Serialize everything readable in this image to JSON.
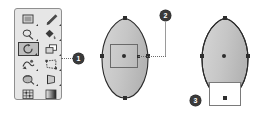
{
  "canvas": {
    "width": 262,
    "height": 120,
    "background": "#ffffff"
  },
  "palette": {
    "name": "tools-palette",
    "background": "#e6e6e6",
    "border": "#8f8f8f",
    "selected_index": 4,
    "tools": [
      {
        "icon": "rectangle-fill-icon",
        "label": "Rectangle",
        "has_flyout": true,
        "selected": false
      },
      {
        "icon": "pencil-icon",
        "label": "Pencil",
        "has_flyout": true,
        "selected": false
      },
      {
        "icon": "lasso-icon",
        "label": "Lasso",
        "has_flyout": true,
        "selected": false
      },
      {
        "icon": "paint-bucket-icon",
        "label": "Paint Bucket",
        "has_flyout": true,
        "selected": false
      },
      {
        "icon": "rotate-tool-icon",
        "label": "Rotate",
        "has_flyout": true,
        "selected": true
      },
      {
        "icon": "transform-copy-icon",
        "label": "Transform",
        "has_flyout": true,
        "selected": false
      },
      {
        "icon": "warp-icon",
        "label": "Warp",
        "has_flyout": true,
        "selected": false
      },
      {
        "icon": "free-distort-icon",
        "label": "Free Distort",
        "has_flyout": true,
        "selected": false
      },
      {
        "icon": "rotate-3d-icon",
        "label": "3D Rotate",
        "has_flyout": true,
        "selected": false
      },
      {
        "icon": "perspective-icon",
        "label": "Perspective",
        "has_flyout": true,
        "selected": false
      },
      {
        "icon": "gradient-mesh-icon",
        "label": "Gradient Mesh",
        "has_flyout": false,
        "selected": false
      },
      {
        "icon": "gradient-swatch-icon",
        "label": "Gradient",
        "has_flyout": false,
        "selected": false
      }
    ]
  },
  "callouts": [
    {
      "number": "1",
      "x": 73,
      "y": 53,
      "target": "palette"
    },
    {
      "number": "2",
      "x": 160,
      "y": 10,
      "target": "center-shape"
    },
    {
      "number": "3",
      "x": 190,
      "y": 95,
      "target": "right-shape"
    }
  ],
  "shapes": {
    "center": {
      "name": "egg-shape-center",
      "fill": "#c9c9c9",
      "stroke": "#2e2e2e",
      "anchors": [
        "top",
        "left",
        "right",
        "bottom"
      ],
      "has_center_point": true,
      "selection_rect": {
        "visible": true,
        "stroke": "#6a6a6a"
      }
    },
    "right": {
      "name": "egg-shape-right",
      "fill": "#c9c9c9",
      "stroke": "#2e2e2e",
      "shaded_band_fill": "#9a9a9a",
      "anchors": [
        "top",
        "left",
        "right",
        "bottom"
      ],
      "has_center_point": true,
      "bottom_rect": {
        "visible": true,
        "fill": "#ffffff",
        "stroke": "#7a7a7a"
      }
    }
  },
  "leaders": {
    "callout1_line": {
      "style": "dotted",
      "color": "#6b6b6b"
    },
    "callout2_line": {
      "style": "dotted-then-solid",
      "color": "#9a9a9a"
    }
  }
}
